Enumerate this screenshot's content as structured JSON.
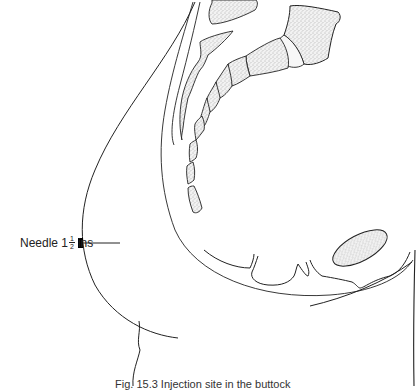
{
  "figure": {
    "label": {
      "text": "Needle 1",
      "fraction_numerator": "1",
      "fraction_denominator": "2",
      "unit": "ins"
    },
    "caption": "Fig. 15.3 Injection site in the buttock",
    "colors": {
      "line": "#222222",
      "bone_fill": "#e8e8e8",
      "needle_hub": "#000000",
      "background": "#ffffff"
    }
  }
}
